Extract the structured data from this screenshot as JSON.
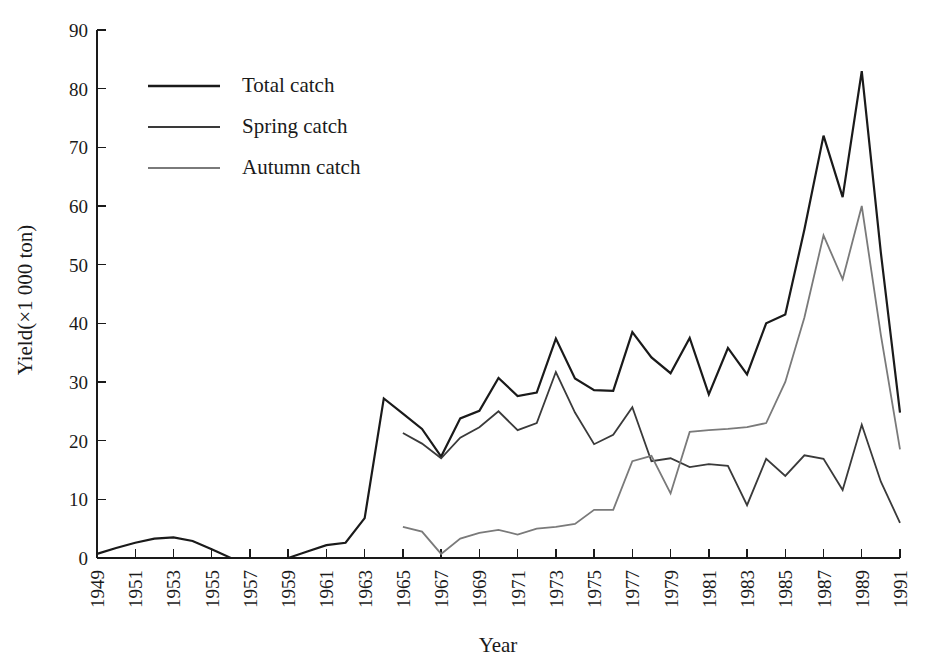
{
  "chart_data": {
    "type": "line",
    "title": "",
    "xlabel": "Year",
    "ylabel": "Yield(×1 000 ton)",
    "xlim": [
      1949,
      1991
    ],
    "ylim": [
      0,
      90
    ],
    "grid": false,
    "legend_position": "top-left",
    "y_ticks": [
      0,
      10,
      20,
      30,
      40,
      50,
      60,
      70,
      80,
      90
    ],
    "x_ticks": [
      1949,
      1951,
      1953,
      1955,
      1957,
      1959,
      1961,
      1963,
      1965,
      1967,
      1969,
      1971,
      1973,
      1975,
      1977,
      1979,
      1981,
      1983,
      1985,
      1987,
      1989,
      1991
    ],
    "x": [
      1949,
      1950,
      1951,
      1952,
      1953,
      1954,
      1955,
      1956,
      1957,
      1958,
      1959,
      1960,
      1961,
      1962,
      1963,
      1964,
      1965,
      1966,
      1967,
      1968,
      1969,
      1970,
      1971,
      1972,
      1973,
      1974,
      1975,
      1976,
      1977,
      1978,
      1979,
      1980,
      1981,
      1982,
      1983,
      1984,
      1985,
      1986,
      1987,
      1988,
      1989,
      1990,
      1991
    ],
    "series": [
      {
        "name": "Total catch",
        "color": "#1a1a1a",
        "width": 2.2,
        "values": [
          0.7,
          1.7,
          2.6,
          3.3,
          3.5,
          2.9,
          1.5,
          0.0,
          0.0,
          0.0,
          0.0,
          1.1,
          2.2,
          2.6,
          6.8,
          27.2,
          24.6,
          22.0,
          17.3,
          23.8,
          25.1,
          30.7,
          27.6,
          28.2,
          37.4,
          30.6,
          28.6,
          28.5,
          38.5,
          34.2,
          31.5,
          37.5,
          27.9,
          35.8,
          31.3,
          40.0,
          41.5,
          56.0,
          72.0,
          61.5,
          83.0,
          52.0,
          24.8
        ]
      },
      {
        "name": "Spring catch",
        "color": "#3a3a3a",
        "width": 1.8,
        "values": [
          null,
          null,
          null,
          null,
          null,
          null,
          null,
          null,
          null,
          null,
          null,
          null,
          null,
          null,
          null,
          null,
          21.3,
          19.5,
          17.0,
          20.5,
          22.3,
          25.0,
          21.8,
          23.0,
          31.7,
          24.8,
          19.4,
          21.0,
          25.7,
          16.5,
          17.0,
          15.5,
          16.0,
          15.7,
          9.0,
          16.9,
          14.0,
          17.5,
          16.9,
          11.6,
          22.7,
          13.0,
          6.0
        ]
      },
      {
        "name": "Autumn catch",
        "color": "#7a7a7a",
        "width": 1.8,
        "values": [
          null,
          null,
          null,
          null,
          null,
          null,
          null,
          null,
          null,
          null,
          null,
          null,
          null,
          null,
          null,
          null,
          5.3,
          4.5,
          0.7,
          3.3,
          4.3,
          4.8,
          4.0,
          5.0,
          5.3,
          5.8,
          8.2,
          8.2,
          16.5,
          17.4,
          11.0,
          21.5,
          21.8,
          22.0,
          22.3,
          23.0,
          30.0,
          41.0,
          55.0,
          47.5,
          60.0,
          38.0,
          18.5
        ]
      }
    ]
  },
  "legend": {
    "items": [
      {
        "label": "Total catch"
      },
      {
        "label": "Spring catch"
      },
      {
        "label": "Autumn catch"
      }
    ]
  }
}
